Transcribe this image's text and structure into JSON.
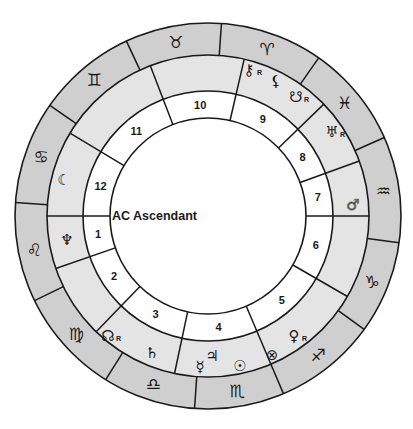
{
  "chart": {
    "title": "",
    "center": [
      208,
      216
    ],
    "radii": {
      "outer": 193,
      "zodiac_inner": 161,
      "planet_inner": 125,
      "house_inner": 98
    },
    "colors": {
      "zodiac_ring": "#cfcfcf",
      "planet_ring": "#e4e4e4",
      "house_ring": "#ffffff",
      "center": "#ffffff",
      "stroke": "#1a1a1a"
    },
    "ascendant": {
      "label": "AC Ascendant",
      "angle": 180
    },
    "zodiac_signs": [
      {
        "name": "Taurus",
        "glyph": "♉",
        "start": 86,
        "end": 115
      },
      {
        "name": "Gemini",
        "glyph": "♊",
        "start": 115,
        "end": 145
      },
      {
        "name": "Cancer",
        "glyph": "♋",
        "start": 145,
        "end": 176
      },
      {
        "name": "Leo",
        "glyph": "♌",
        "start": 176,
        "end": 206
      },
      {
        "name": "Virgo",
        "glyph": "♍",
        "start": 206,
        "end": 238
      },
      {
        "name": "Libra",
        "glyph": "♎",
        "start": 238,
        "end": 266
      },
      {
        "name": "Scorpio",
        "glyph": "♏",
        "start": 266,
        "end": 293
      },
      {
        "name": "Sagittarius",
        "glyph": "♐",
        "start": 293,
        "end": 324
      },
      {
        "name": "Capricorn",
        "glyph": "♑",
        "start": 324,
        "end": 352
      },
      {
        "name": "Aquarius",
        "glyph": "♒",
        "start": 352,
        "end": 384
      },
      {
        "name": "Pisces",
        "glyph": "♓",
        "start": 24,
        "end": 55
      },
      {
        "name": "Aries",
        "glyph": "♈",
        "start": 55,
        "end": 86
      }
    ],
    "houses": [
      {
        "number": "1",
        "start": 180,
        "end": 199
      },
      {
        "number": "2",
        "start": 199,
        "end": 226
      },
      {
        "number": "3",
        "start": 226,
        "end": 258
      },
      {
        "number": "4",
        "start": 258,
        "end": 293
      },
      {
        "number": "5",
        "start": 293,
        "end": 330
      },
      {
        "number": "6",
        "start": 330,
        "end": 360
      },
      {
        "number": "7",
        "start": 0,
        "end": 20
      },
      {
        "number": "8",
        "start": 20,
        "end": 44
      },
      {
        "number": "9",
        "start": 44,
        "end": 77
      },
      {
        "number": "10",
        "start": 77,
        "end": 111
      },
      {
        "number": "11",
        "start": 111,
        "end": 149
      },
      {
        "number": "12",
        "start": 149,
        "end": 180
      }
    ],
    "planets": [
      {
        "name": "Chiron",
        "glyph": "⚷",
        "retrograde": true,
        "x": 249,
        "y": 70
      },
      {
        "name": "Lilith",
        "glyph": "⚸",
        "retrograde": false,
        "x": 276,
        "y": 81
      },
      {
        "name": "South Node",
        "glyph": "☋",
        "retrograde": true,
        "x": 296,
        "y": 97
      },
      {
        "name": "Uranus",
        "glyph": "♅",
        "retrograde": true,
        "x": 332,
        "y": 132
      },
      {
        "name": "Mars",
        "glyph": "♂",
        "retrograde": false,
        "x": 353,
        "y": 205,
        "faded": true
      },
      {
        "name": "Venus",
        "glyph": "♀",
        "retrograde": true,
        "x": 294,
        "y": 336
      },
      {
        "name": "Part of Fortune",
        "glyph": "⊗",
        "retrograde": false,
        "x": 272,
        "y": 355
      },
      {
        "name": "Sun",
        "glyph": "☉",
        "retrograde": false,
        "x": 240,
        "y": 366
      },
      {
        "name": "Jupiter",
        "glyph": "♃",
        "retrograde": false,
        "x": 212,
        "y": 356
      },
      {
        "name": "Mercury",
        "glyph": "☿",
        "retrograde": false,
        "x": 200,
        "y": 367
      },
      {
        "name": "Saturn",
        "glyph": "♄",
        "retrograde": false,
        "x": 152,
        "y": 353
      },
      {
        "name": "North Node",
        "glyph": "☊",
        "retrograde": true,
        "x": 108,
        "y": 336
      },
      {
        "name": "Neptune",
        "glyph": "♆",
        "retrograde": false,
        "x": 67,
        "y": 240
      },
      {
        "name": "Moon",
        "glyph": "☾",
        "retrograde": false,
        "x": 64,
        "y": 180
      }
    ],
    "retrograde_marker": "R"
  }
}
